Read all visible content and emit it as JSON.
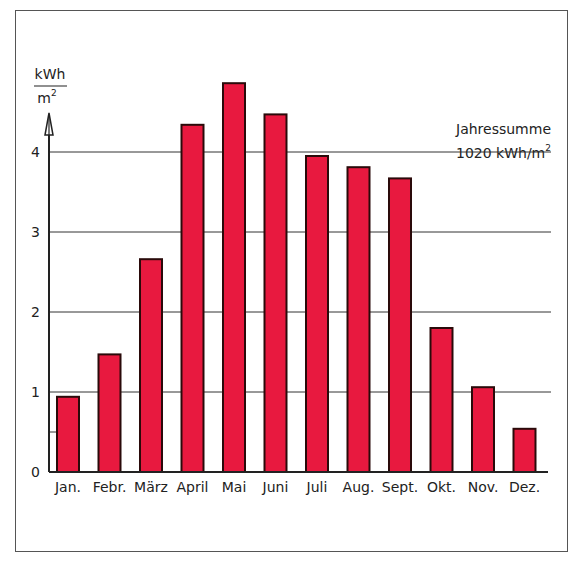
{
  "chart_data": {
    "type": "bar",
    "title": "",
    "annotation": {
      "line1": "Jahressumme",
      "line2_prefix": "1020 kWh/m",
      "line2_sup": "2"
    },
    "ylabel": {
      "numerator": "kWh",
      "denominator": "m",
      "denominator_sup": "2"
    },
    "xlabel": "",
    "categories": [
      "Jan.",
      "Febr.",
      "März",
      "April",
      "Mai",
      "Juni",
      "Juli",
      "Aug.",
      "Sept.",
      "Okt.",
      "Nov.",
      "Dez."
    ],
    "values": [
      0.94,
      1.47,
      2.66,
      4.34,
      4.86,
      4.47,
      3.95,
      3.81,
      3.67,
      1.8,
      1.06,
      0.54
    ],
    "ylim": [
      0,
      5
    ],
    "yticks": [
      0,
      1,
      2,
      3,
      4
    ],
    "ytick_labels": [
      "0",
      "1",
      "2",
      "3",
      "4"
    ],
    "minor_tick": 0.5,
    "grid": true,
    "legend": null,
    "bar_color": "#E8193F",
    "bar_edge_color": "#2a0a0a"
  }
}
